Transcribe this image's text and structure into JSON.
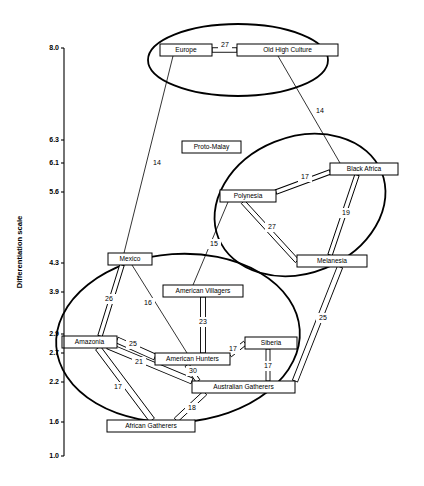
{
  "figure": {
    "type": "network-diagram",
    "background": "#ffffff",
    "stroke_color": "#000000",
    "width": 424,
    "height": 486
  },
  "axis": {
    "title": "Differentiation scale",
    "ticks": [
      {
        "label": "8.0",
        "y": 48
      },
      {
        "label": "6.3",
        "y": 140
      },
      {
        "label": "6.1",
        "y": 163
      },
      {
        "label": "5.6",
        "y": 192
      },
      {
        "label": "4.3",
        "y": 263
      },
      {
        "label": "3.9",
        "y": 292
      },
      {
        "label": "2.9",
        "y": 334
      },
      {
        "label": "2.7",
        "y": 353
      },
      {
        "label": "2.2",
        "y": 382
      },
      {
        "label": "1.6",
        "y": 422
      },
      {
        "label": "1.0",
        "y": 456
      }
    ],
    "axis_x": 64,
    "axis_top": 48,
    "axis_bottom": 456
  },
  "nodes": [
    {
      "id": "europe",
      "label": "Europe",
      "x": 160,
      "y": 44,
      "w": 52,
      "h": 12
    },
    {
      "id": "old_high_culture",
      "label": "Old High Culture",
      "x": 237,
      "y": 44,
      "w": 101,
      "h": 12
    },
    {
      "id": "proto_malay",
      "label": "Proto-Malay",
      "x": 182,
      "y": 141,
      "w": 59,
      "h": 12
    },
    {
      "id": "black_africa",
      "label": "Black Africa",
      "x": 330,
      "y": 163,
      "w": 68,
      "h": 12
    },
    {
      "id": "polynesia",
      "label": "Polynesia",
      "x": 220,
      "y": 190,
      "w": 56,
      "h": 12
    },
    {
      "id": "melanesia",
      "label": "Melanesia",
      "x": 297,
      "y": 255,
      "w": 70,
      "h": 12
    },
    {
      "id": "mexico",
      "label": "Mexico",
      "x": 108,
      "y": 253,
      "w": 44,
      "h": 12
    },
    {
      "id": "american_villagers",
      "label": "American Villagers",
      "x": 163,
      "y": 285,
      "w": 80,
      "h": 12
    },
    {
      "id": "amazonia",
      "label": "Amazonia",
      "x": 62,
      "y": 336,
      "w": 55,
      "h": 12
    },
    {
      "id": "american_hunters",
      "label": "American Hunters",
      "x": 155,
      "y": 353,
      "w": 75,
      "h": 12
    },
    {
      "id": "siberia",
      "label": "Siberia",
      "x": 245,
      "y": 337,
      "w": 52,
      "h": 12
    },
    {
      "id": "australian_gatherers",
      "label": "Australian Gatherers",
      "x": 192,
      "y": 381,
      "w": 103,
      "h": 12
    },
    {
      "id": "african_gatherers",
      "label": "African Gatherers",
      "x": 107,
      "y": 420,
      "w": 88,
      "h": 12
    }
  ],
  "thick_links": [
    {
      "from": "europe",
      "to": "old_high_culture",
      "label": "27",
      "x1": 212,
      "y1": 50,
      "x2": 237,
      "y2": 50,
      "wide": 4.5,
      "lx": 225,
      "ly": 45
    },
    {
      "from": "polynesia",
      "to": "black_africa",
      "label": "17",
      "x1": 276,
      "y1": 192,
      "x2": 330,
      "y2": 172,
      "wide": 4.5,
      "lx": 305,
      "ly": 177
    },
    {
      "from": "black_africa",
      "to": "melanesia",
      "label": "19",
      "x1": 357,
      "y1": 175,
      "x2": 330,
      "y2": 255,
      "wide": 4.5,
      "lx": 346,
      "ly": 213
    },
    {
      "from": "polynesia",
      "to": "melanesia",
      "label": "27",
      "x1": 243,
      "y1": 202,
      "x2": 297,
      "y2": 261,
      "wide": 4.5,
      "lx": 272,
      "ly": 227
    },
    {
      "from": "melanesia",
      "to": "australian_gatherers",
      "label": "25",
      "x1": 340,
      "y1": 267,
      "x2": 295,
      "y2": 381,
      "wide": 5.5,
      "lx": 323,
      "ly": 318
    },
    {
      "from": "mexico",
      "to": "amazonia",
      "label": "26",
      "x1": 122,
      "y1": 265,
      "x2": 100,
      "y2": 336,
      "wide": 4.5,
      "lx": 109,
      "ly": 299
    },
    {
      "from": "amazonia",
      "to": "american_hunters",
      "label": "25",
      "x1": 117,
      "y1": 340,
      "x2": 155,
      "y2": 357,
      "wide": 6,
      "lx": 133,
      "ly": 344
    },
    {
      "from": "amazonia",
      "to": "australian_gatherers",
      "label": "21",
      "x1": 108,
      "y1": 346,
      "x2": 192,
      "y2": 381,
      "wide": 6,
      "lx": 139,
      "ly": 362
    },
    {
      "from": "amazonia",
      "to": "african_gatherers",
      "label": "17",
      "x1": 98,
      "y1": 348,
      "x2": 152,
      "y2": 420,
      "wide": 6,
      "lx": 118,
      "ly": 387
    },
    {
      "from": "american_villagers",
      "to": "american_hunters",
      "label": "23",
      "x1": 203,
      "y1": 297,
      "x2": 203,
      "y2": 353,
      "wide": 5,
      "lx": 203,
      "ly": 322
    },
    {
      "from": "american_hunters",
      "to": "siberia",
      "label": "17",
      "x1": 230,
      "y1": 355,
      "x2": 245,
      "y2": 343,
      "wide": 4.5,
      "lx": 233,
      "ly": 349
    },
    {
      "from": "siberia",
      "to": "australian_gatherers",
      "label": "17",
      "x1": 268,
      "y1": 349,
      "x2": 268,
      "y2": 381,
      "wide": 4,
      "lx": 268,
      "ly": 366
    },
    {
      "from": "american_hunters",
      "to": "australian_gatherers",
      "label": "30",
      "x1": 187,
      "y1": 365,
      "x2": 198,
      "y2": 381,
      "wide": 4.5,
      "lx": 193,
      "ly": 371
    },
    {
      "from": "australian_gatherers",
      "to": "african_gatherers",
      "label": "18",
      "x1": 205,
      "y1": 393,
      "x2": 176,
      "y2": 420,
      "wide": 5,
      "lx": 192,
      "ly": 408
    }
  ],
  "thin_links": [
    {
      "from": "europe",
      "to": "mexico",
      "label": "14",
      "x1": 173,
      "y1": 56,
      "x2": 124,
      "y2": 253,
      "lx": 157,
      "ly": 163
    },
    {
      "from": "old_high_culture",
      "to": "black_africa",
      "label": "14",
      "x1": 278,
      "y1": 56,
      "x2": 340,
      "y2": 163,
      "lx": 320,
      "ly": 111
    },
    {
      "from": "polynesia",
      "to": "american_villagers",
      "label": "15",
      "x1": 228,
      "y1": 202,
      "x2": 193,
      "y2": 285,
      "lx": 214,
      "ly": 244
    },
    {
      "from": "mexico",
      "to": "american_hunters",
      "label": "16",
      "x1": 132,
      "y1": 265,
      "x2": 187,
      "y2": 353,
      "lx": 148,
      "ly": 303
    }
  ],
  "clusters": [
    {
      "id": "cluster-old-world",
      "cx": 238,
      "cy": 60,
      "rx": 90,
      "ry": 36,
      "rot": 0
    },
    {
      "id": "cluster-africa-oceania",
      "cx": 300,
      "cy": 205,
      "rx": 88,
      "ry": 68,
      "rot": -22
    },
    {
      "id": "cluster-new-world",
      "cx": 178,
      "cy": 338,
      "rx": 122,
      "ry": 84,
      "rot": -4
    }
  ]
}
